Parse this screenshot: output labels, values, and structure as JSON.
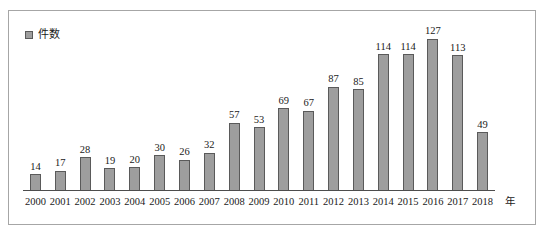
{
  "legend": {
    "label": "件数",
    "marker_icon": "square-swatch-icon",
    "marker_color": "#9e9e9e",
    "marker_border_color": "#5a5a5a"
  },
  "axis": {
    "unit_label": "年"
  },
  "style": {
    "bar_fill": "#9e9e9e",
    "bar_border": "#5a5a5a",
    "frame_border": "#a6a6a6",
    "axis_line": "#4d4d4d",
    "background": "#ffffff",
    "text_color": "#1a1a1a"
  },
  "chart_data": {
    "type": "bar",
    "title": "",
    "xlabel": "年",
    "ylabel": "",
    "ylim": [
      0,
      140
    ],
    "grid": false,
    "legend_position": "top-left",
    "series": [
      {
        "name": "件数",
        "values": [
          14,
          17,
          28,
          19,
          20,
          30,
          26,
          32,
          57,
          53,
          69,
          67,
          87,
          85,
          114,
          114,
          127,
          113,
          49
        ]
      }
    ],
    "categories": [
      "2000",
      "2001",
      "2002",
      "2003",
      "2004",
      "2005",
      "2006",
      "2007",
      "2008",
      "2009",
      "2010",
      "2011",
      "2012",
      "2013",
      "2014",
      "2015",
      "2016",
      "2017",
      "2018"
    ],
    "data_labels": [
      "14",
      "17",
      "28",
      "19",
      "20",
      "30",
      "26",
      "32",
      "57",
      "53",
      "69",
      "67",
      "87",
      "85",
      "114",
      "114",
      "127",
      "113",
      "49"
    ]
  }
}
